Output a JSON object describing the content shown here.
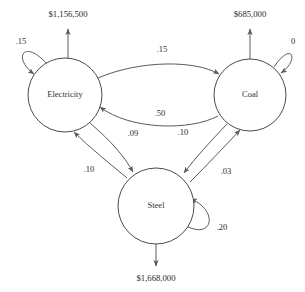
{
  "diagram": {
    "type": "directed-flow-graph",
    "title": "",
    "background_color": "#ffffff",
    "stroke_color": "#5a5a5a",
    "text_color": "#2a2725",
    "nodes": [
      {
        "id": "electricity",
        "label": "Electricity",
        "cx": 65,
        "cy": 95,
        "r": 37
      },
      {
        "id": "coal",
        "label": "Coal",
        "cx": 250,
        "cy": 95,
        "r": 36
      },
      {
        "id": "steel",
        "label": "Steel",
        "cx": 156,
        "cy": 206,
        "r": 38
      }
    ],
    "outputs": [
      {
        "id": "electricity-output",
        "from": "electricity",
        "label": "$1,156,500",
        "direction": "up",
        "label_x": 68,
        "label_y": 15
      },
      {
        "id": "coal-output",
        "from": "coal",
        "label": "$685,000",
        "direction": "up",
        "label_x": 250,
        "label_y": 15
      },
      {
        "id": "steel-output",
        "from": "steel",
        "label": "$1,668,000",
        "direction": "down",
        "label_x": 156,
        "label_y": 279
      }
    ],
    "edges": [
      {
        "id": "electricity-to-coal",
        "from": "electricity",
        "to": "coal",
        "label": ".15",
        "label_x": 162,
        "label_y": 50
      },
      {
        "id": "coal-to-electricity",
        "from": "coal",
        "to": "electricity",
        "label": ".50",
        "label_x": 160,
        "label_y": 114
      },
      {
        "id": "electricity-to-steel",
        "from": "electricity",
        "to": "steel",
        "label": ".09",
        "label_x": 133,
        "label_y": 134
      },
      {
        "id": "steel-to-electricity",
        "from": "steel",
        "to": "electricity",
        "label": ".10",
        "label_x": 89,
        "label_y": 170
      },
      {
        "id": "coal-to-steel",
        "from": "coal",
        "to": "steel",
        "label": ".10",
        "label_x": 183,
        "label_y": 133
      },
      {
        "id": "steel-to-coal",
        "from": "steel",
        "to": "coal",
        "label": ".03",
        "label_x": 226,
        "label_y": 172
      }
    ],
    "self_loops": [
      {
        "id": "electricity-self-loop",
        "node": "electricity",
        "label": ".15",
        "label_x": 21,
        "label_y": 42
      },
      {
        "id": "coal-self-loop",
        "node": "coal",
        "label": "0",
        "label_x": 293,
        "label_y": 42
      },
      {
        "id": "steel-self-loop",
        "node": "steel",
        "label": ".20",
        "label_x": 222,
        "label_y": 228
      }
    ]
  }
}
